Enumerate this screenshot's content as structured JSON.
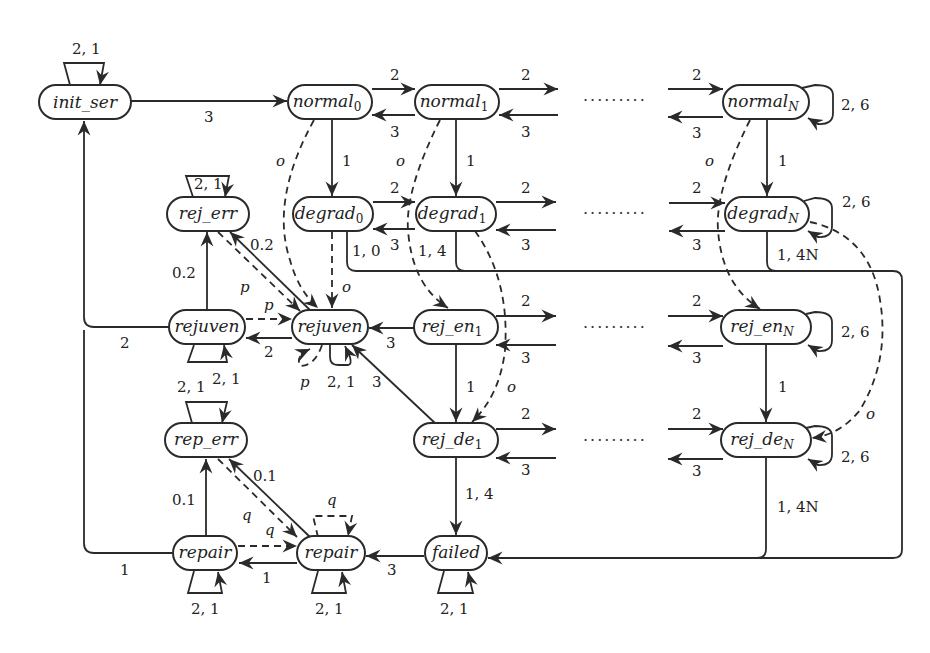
{
  "diagram": {
    "type": "state-transition-graph",
    "nodes": [
      {
        "id": "init_ser",
        "label": "init_ser",
        "cx": 85,
        "cy": 102,
        "w": 92
      },
      {
        "id": "normal0",
        "label": "normal",
        "sub": "0",
        "cx": 330,
        "cy": 102,
        "w": 84
      },
      {
        "id": "normal1",
        "label": "normal",
        "sub": "1",
        "cx": 457,
        "cy": 102,
        "w": 84
      },
      {
        "id": "normalN",
        "label": "normal",
        "sub": "N",
        "cx": 766,
        "cy": 102,
        "w": 86
      },
      {
        "id": "rej_err",
        "label": "rej_err",
        "cx": 208,
        "cy": 214,
        "w": 82
      },
      {
        "id": "degrad0",
        "label": "degrad",
        "sub": "0",
        "cx": 333,
        "cy": 214,
        "w": 80
      },
      {
        "id": "degrad1",
        "label": "degrad",
        "sub": "1",
        "cx": 456,
        "cy": 214,
        "w": 80
      },
      {
        "id": "degradN",
        "label": "degrad",
        "sub": "N",
        "cx": 767,
        "cy": 214,
        "w": 84
      },
      {
        "id": "rejuven_l",
        "label": "rejuven",
        "cx": 207,
        "cy": 327,
        "w": 76
      },
      {
        "id": "rejuven_m",
        "label": "rejuven",
        "cx": 330,
        "cy": 327,
        "w": 76
      },
      {
        "id": "rej_en1",
        "label": "rej_en",
        "sub": "1",
        "cx": 456,
        "cy": 327,
        "w": 84
      },
      {
        "id": "rej_enN",
        "label": "rej_en",
        "sub": "N",
        "cx": 766,
        "cy": 327,
        "w": 90
      },
      {
        "id": "rep_err",
        "label": "rep_err",
        "cx": 206,
        "cy": 440,
        "w": 82
      },
      {
        "id": "rej_de1",
        "label": "rej_de",
        "sub": "1",
        "cx": 456,
        "cy": 440,
        "w": 84
      },
      {
        "id": "rej_deN",
        "label": "rej_de",
        "sub": "N",
        "cx": 766,
        "cy": 440,
        "w": 90
      },
      {
        "id": "repair_l",
        "label": "repair",
        "cx": 205,
        "cy": 553,
        "w": 64
      },
      {
        "id": "repair_m",
        "label": "repair",
        "cx": 330,
        "cy": 553,
        "w": 66
      },
      {
        "id": "failed",
        "label": "failed",
        "cx": 456,
        "cy": 553,
        "w": 62
      }
    ],
    "labels": {
      "init_loop": "2, 1",
      "init_to_normal0": "3",
      "normal_fwd": "2",
      "normal_back": "3",
      "normalN_loop": "2, 6",
      "down_1": "1",
      "o": "o",
      "p": "p",
      "q": "q",
      "degrad0_to_failed": "1, 0",
      "degrad1_to_failed": "1, 4",
      "degradN_to_failed": "1, 4N",
      "degradN_loop": "2, 6",
      "rej_err_loop": "2, 1",
      "rej_err_rate": "0.2",
      "rejuven_to_init": "2",
      "rejuven_back": "2",
      "rejuven_loop": "2, 1",
      "rej_en_to_rejuven": "3",
      "rej_de_to_rejuven": "3",
      "rej_enN_loop": "2, 6",
      "rej_deN_loop": "2, 6",
      "rej_de1_to_failed": "1, 4",
      "rej_deN_to_failed": "1, 4N",
      "rep_err_loop": "2, 1",
      "rep_err_rate": "0.1",
      "repair_to_init": "1",
      "repair_back": "1",
      "repair_loop": "2, 1",
      "failed_to_repair": "3",
      "failed_loop": "2, 1",
      "ellipsis": "·········"
    }
  }
}
